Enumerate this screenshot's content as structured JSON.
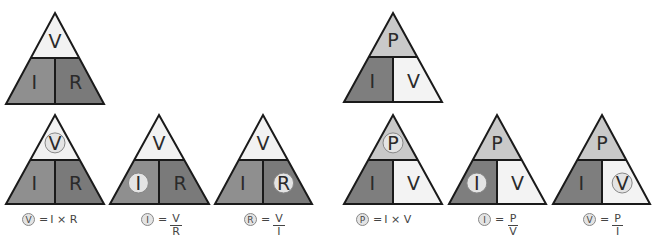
{
  "colors": {
    "outline": "#1a1a1a",
    "vir_top": "#f2f2f2",
    "vir_left": "#8f8f8f",
    "vir_right": "#7a7a7a",
    "piv_top": "#c9c9c9",
    "piv_left": "#7e7e7e",
    "piv_right": "#f3f3f3",
    "highlight_circle": "#e4e4e4"
  },
  "triangles": [
    {
      "id": "vir-main",
      "apex": [
        55,
        13
      ],
      "base_y": 104,
      "base_x": [
        6,
        104
      ],
      "div_y": 58,
      "top": "V",
      "left": "I",
      "right": "R",
      "scheme": "vir",
      "highlight": null
    },
    {
      "id": "piv-main",
      "apex": [
        393,
        13
      ],
      "base_y": 102,
      "base_x": [
        344,
        442
      ],
      "div_y": 57,
      "top": "P",
      "left": "I",
      "right": "V",
      "scheme": "piv",
      "highlight": null
    },
    {
      "id": "vir-solve-v",
      "apex": [
        55,
        115
      ],
      "base_y": 204,
      "base_x": [
        6,
        104
      ],
      "div_y": 160,
      "top": "V",
      "left": "I",
      "right": "R",
      "scheme": "vir",
      "highlight": "top"
    },
    {
      "id": "vir-solve-i",
      "apex": [
        159,
        115
      ],
      "base_y": 204,
      "base_x": [
        110,
        209
      ],
      "div_y": 160,
      "top": "V",
      "left": "I",
      "right": "R",
      "scheme": "vir",
      "highlight": "left"
    },
    {
      "id": "vir-solve-r",
      "apex": [
        263,
        115
      ],
      "base_y": 204,
      "base_x": [
        215,
        312
      ],
      "div_y": 160,
      "top": "V",
      "left": "I",
      "right": "R",
      "scheme": "vir",
      "highlight": "right"
    },
    {
      "id": "piv-solve-p",
      "apex": [
        393,
        115
      ],
      "base_y": 204,
      "base_x": [
        344,
        442
      ],
      "div_y": 160,
      "top": "P",
      "left": "I",
      "right": "V",
      "scheme": "piv",
      "highlight": "top"
    },
    {
      "id": "piv-solve-i",
      "apex": [
        497,
        115
      ],
      "base_y": 204,
      "base_x": [
        449,
        546
      ],
      "div_y": 160,
      "top": "P",
      "left": "I",
      "right": "V",
      "scheme": "piv",
      "highlight": "left"
    },
    {
      "id": "piv-solve-v",
      "apex": [
        602,
        115
      ],
      "base_y": 204,
      "base_x": [
        553,
        650
      ],
      "div_y": 160,
      "top": "P",
      "left": "I",
      "right": "V",
      "scheme": "piv",
      "highlight": "right"
    }
  ],
  "formulas": [
    {
      "id": "v-eq",
      "x": 22,
      "y": 213,
      "subject": "V",
      "eq": "=",
      "type": "product",
      "expr": "I × R"
    },
    {
      "id": "i-eq-vir",
      "x": 141,
      "y": 213,
      "subject": "I",
      "eq": "=",
      "type": "fraction",
      "num": "V",
      "den": "R"
    },
    {
      "id": "r-eq",
      "x": 244,
      "y": 213,
      "subject": "R",
      "eq": "=",
      "type": "fraction",
      "num": "V",
      "den": "I"
    },
    {
      "id": "p-eq",
      "x": 356,
      "y": 213,
      "subject": "P",
      "eq": "=",
      "type": "product",
      "expr": "I × V"
    },
    {
      "id": "i-eq-piv",
      "x": 478,
      "y": 213,
      "subject": "I",
      "eq": "=",
      "type": "fraction",
      "num": "P",
      "den": "V"
    },
    {
      "id": "v-eq-piv",
      "x": 583,
      "y": 213,
      "subject": "V",
      "eq": "=",
      "type": "fraction",
      "num": "P",
      "den": "I"
    }
  ]
}
